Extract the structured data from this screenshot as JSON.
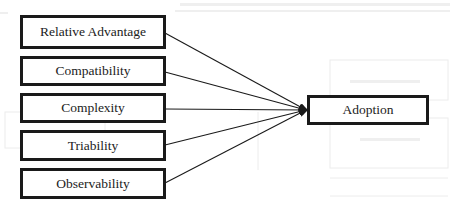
{
  "diagram": {
    "type": "flow-model",
    "inputs": [
      {
        "id": "relative-advantage",
        "label": "Relative Advantage"
      },
      {
        "id": "compatibility",
        "label": "Compatibility"
      },
      {
        "id": "complexity",
        "label": "Complexity"
      },
      {
        "id": "triability",
        "label": "Triability"
      },
      {
        "id": "observability",
        "label": "Observability"
      }
    ],
    "output": {
      "id": "adoption",
      "label": "Adoption"
    },
    "edges": [
      {
        "from": "relative-advantage",
        "to": "adoption"
      },
      {
        "from": "compatibility",
        "to": "adoption"
      },
      {
        "from": "complexity",
        "to": "adoption"
      },
      {
        "from": "triability",
        "to": "adoption"
      },
      {
        "from": "observability",
        "to": "adoption"
      }
    ],
    "colors": {
      "stroke": "#1a1a1a",
      "text": "#222222",
      "background": "#ffffff"
    }
  }
}
